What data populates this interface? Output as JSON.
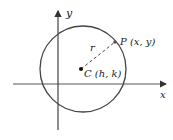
{
  "diagram": {
    "type": "circle-on-coordinate-plane",
    "axes": {
      "x_label": "x",
      "y_label": "y"
    },
    "center": {
      "label": "C (h, k)"
    },
    "point": {
      "label": "P (x, y)"
    },
    "radius": {
      "label": "r",
      "style": "dashed"
    },
    "colors": {
      "stroke": "#444444",
      "text": "#222222",
      "background": "#ffffff"
    }
  }
}
